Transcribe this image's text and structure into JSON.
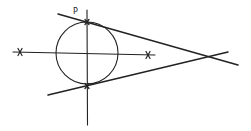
{
  "diagram": {
    "title": "",
    "labels": {
      "point_p": "P"
    },
    "stroke_color": "#222222",
    "background": "#ffffff",
    "circle": {
      "cx": 87,
      "cy": 53,
      "r": 31
    },
    "axes": {
      "vertical": {
        "x1": 87,
        "y1": 10,
        "x2": 87,
        "y2": 125
      },
      "horizontal": {
        "x1": 13,
        "y1": 52,
        "x2": 155,
        "y2": 55
      }
    },
    "tangent_lines": [
      {
        "name": "upper",
        "x1": 58,
        "y1": 14,
        "x2": 238,
        "y2": 65
      },
      {
        "name": "lower",
        "x1": 48,
        "y1": 95,
        "x2": 228,
        "y2": 52
      }
    ],
    "cross_marks": [
      {
        "name": "left-mark",
        "x": 20,
        "y": 52
      },
      {
        "name": "right-mark",
        "x": 148,
        "y": 55
      }
    ],
    "tangent_points": [
      {
        "name": "upper-tangent-point",
        "x": 87,
        "y": 22
      },
      {
        "name": "lower-tangent-point",
        "x": 87,
        "y": 86
      }
    ],
    "intersection": {
      "x": 210,
      "y": 57
    }
  }
}
